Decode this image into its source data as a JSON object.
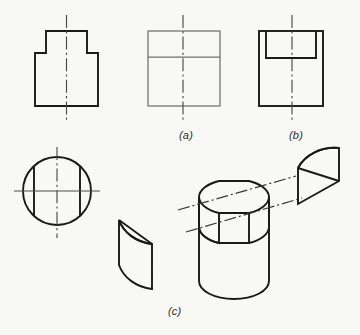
{
  "document": {
    "kind": "engineering-drawing-plate",
    "background_color": "#f8f8f7",
    "ink_color": "#1a1a1a",
    "thin_ink_color": "#6a6a6a"
  },
  "labels": {
    "a": "(a)",
    "b": "(b)",
    "c": "(c)"
  },
  "views": {
    "front_view": {
      "name": "front-view-stepped-profile",
      "description": "Stepped T shaped outline with vertical dash-dot centerline"
    },
    "top_view": {
      "name": "top-view-circle-with-chords",
      "description": "Circle with two vertical chord lines, horizontal solid centerline and vertical dash-dot centerline"
    },
    "side_view_a": {
      "name": "side-view-option-a",
      "description": "Rectangle divided by one horizontal line, vertical dash-dot centerline"
    },
    "side_view_b": {
      "name": "side-view-option-b",
      "description": "Rectangle with inner rectangle at top, vertical dash-dot centerline"
    },
    "pictorial_c": {
      "name": "pictorial-cut-cylinder",
      "description": "Isometric cylinder with two flat side cuts and a dash-dot axis, shown with the two removed segment solids"
    },
    "segment_left": {
      "name": "removed-segment-left",
      "description": "Isometric of left removed curved segment piece"
    },
    "segment_right": {
      "name": "removed-segment-right",
      "description": "Isometric of right removed curved segment piece"
    }
  },
  "bleed_text": {
    "visible": true,
    "note": ""
  }
}
